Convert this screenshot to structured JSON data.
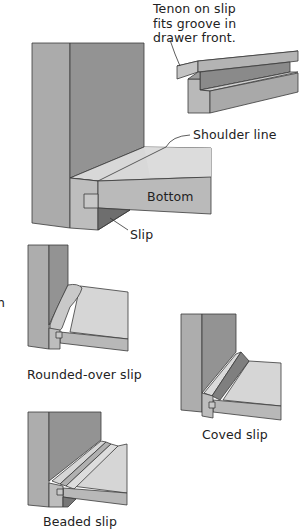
{
  "figure": {
    "type": "technical-illustration",
    "colors": {
      "panel_light": "#acacac",
      "panel_dark": "#8f8f8f",
      "surface_light": "#d6d6d6",
      "face_mid": "#b8b8b8",
      "edge": "#3a3a3a",
      "slip_shadow": "#6f6f6f"
    }
  },
  "labels": {
    "tenon_line1": "Tenon on slip",
    "tenon_line2": "fits groove in",
    "tenon_line3": "drawer front.",
    "shoulder": "Shoulder line",
    "bottom": "Bottom",
    "slip": "Slip",
    "rounded": "Rounded-over slip",
    "coved": "Coved slip",
    "beaded": "Beaded slip",
    "cropped_fragment_1": "l",
    "cropped_fragment_2": "h"
  },
  "views": [
    {
      "name": "slip-detail",
      "caption_key": "tenon"
    },
    {
      "name": "main-assembly",
      "callouts": [
        "Shoulder line",
        "Bottom",
        "Slip"
      ]
    },
    {
      "name": "rounded-over-slip",
      "caption": "Rounded-over slip"
    },
    {
      "name": "coved-slip",
      "caption": "Coved slip"
    },
    {
      "name": "beaded-slip",
      "caption": "Beaded slip"
    }
  ]
}
